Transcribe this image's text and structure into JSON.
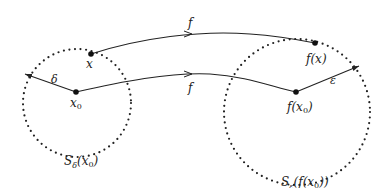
{
  "diagram": {
    "left_neighborhood": {
      "label_main": "S",
      "label_sub": "δ",
      "label_arg": "(x",
      "label_arg_sub": "0",
      "label_close": ")"
    },
    "right_neighborhood": {
      "label_main": "S",
      "label_sub": "ε",
      "label_arg": "(f(x",
      "label_arg_sub": "0",
      "label_close": "))"
    },
    "points": {
      "x": "x",
      "x0_main": "x",
      "x0_sub": "0",
      "fx": "f(x)",
      "fx0_main": "f(x",
      "fx0_sub": "0",
      "fx0_close": ")"
    },
    "radius_labels": {
      "delta": "δ",
      "epsilon": "ε"
    },
    "map_labels": {
      "upper": "f",
      "lower": "f"
    },
    "colors": {
      "stroke": "#222222",
      "background": "#ffffff"
    }
  }
}
